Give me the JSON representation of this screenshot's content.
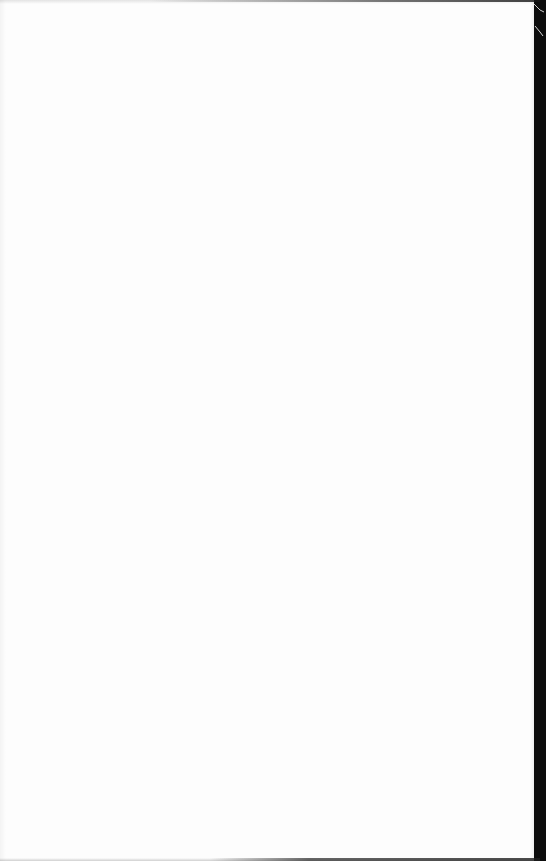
{
  "page": {
    "kind": "blank-scanned-page",
    "background_color": "#fdfdfd",
    "margin_color": "#0c0c0c",
    "text": ""
  }
}
